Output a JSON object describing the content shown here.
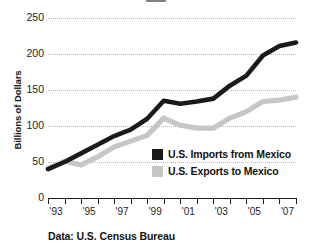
{
  "chart_data": {
    "type": "line",
    "title": "",
    "xlabel": "",
    "ylabel": "Billions of Dollars",
    "source_note": "Data: U.S. Census Bureau",
    "grid": true,
    "legend_position": "inside-center-right",
    "xlim": [
      1993,
      2008
    ],
    "ylim": [
      0,
      250
    ],
    "yticks": [
      0,
      50,
      100,
      150,
      200,
      250
    ],
    "ytick_labels": [
      "0",
      "50",
      "100",
      "150",
      "200",
      "250"
    ],
    "x": [
      1993,
      1994,
      1995,
      1996,
      1997,
      1998,
      1999,
      2000,
      2001,
      2002,
      2003,
      2004,
      2005,
      2006,
      2007,
      2008
    ],
    "xtick_labels": [
      "'93",
      "",
      "'95",
      "",
      "'97",
      "",
      "'99",
      "",
      "'01",
      "",
      "'03",
      "",
      "'05",
      "",
      "'07",
      ""
    ],
    "xtick_years": [
      1993,
      1994,
      1995,
      1996,
      1997,
      1998,
      1999,
      2000,
      2001,
      2002,
      2003,
      2004,
      2005,
      2006,
      2007,
      2008
    ],
    "xtick_label_years": [
      1993,
      1995,
      1997,
      1999,
      2001,
      2003,
      2005,
      2007
    ],
    "series": [
      {
        "name": "U.S. Imports from Mexico",
        "color": "#1a1a1a",
        "values": [
          40,
          50,
          62,
          74,
          86,
          95,
          110,
          135,
          131,
          134,
          138,
          156,
          170,
          198,
          211,
          216
        ]
      },
      {
        "name": "U.S. Exports to Mexico",
        "color": "#c6c6c6",
        "values": [
          41,
          51,
          46,
          57,
          71,
          79,
          87,
          111,
          101,
          97,
          97,
          111,
          120,
          134,
          136,
          140
        ]
      }
    ]
  },
  "legend": {
    "items": [
      {
        "label": "U.S. Imports from Mexico",
        "color": "#1a1a1a"
      },
      {
        "label": "U.S. Exports to Mexico",
        "color": "#c6c6c6"
      }
    ]
  },
  "axis": {
    "y_title": "Billions of Dollars"
  },
  "footer": {
    "source": "Data: U.S. Census Bureau"
  }
}
